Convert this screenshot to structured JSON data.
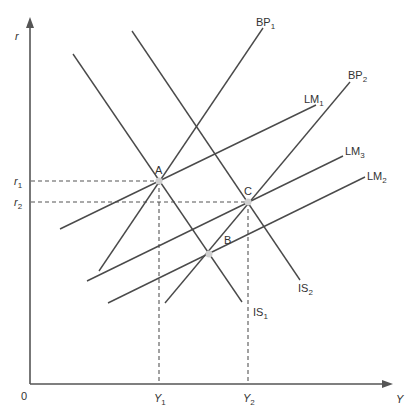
{
  "diagram": {
    "type": "IS-LM-BP",
    "axes": {
      "y_label": "r",
      "x_label": "Y",
      "origin_label": "0"
    },
    "y_ticks": [
      {
        "label": "r",
        "sub": "1",
        "id": "r1"
      },
      {
        "label": "r",
        "sub": "2",
        "id": "r2"
      }
    ],
    "x_ticks": [
      {
        "label": "Y",
        "sub": "1",
        "id": "Y1"
      },
      {
        "label": "Y",
        "sub": "2",
        "id": "Y2"
      }
    ],
    "curves": [
      {
        "name": "IS",
        "sub": "1",
        "id": "IS1"
      },
      {
        "name": "IS",
        "sub": "2",
        "id": "IS2"
      },
      {
        "name": "BP",
        "sub": "1",
        "id": "BP1"
      },
      {
        "name": "BP",
        "sub": "2",
        "id": "BP2"
      },
      {
        "name": "LM",
        "sub": "1",
        "id": "LM1"
      },
      {
        "name": "LM",
        "sub": "3",
        "id": "LM3"
      },
      {
        "name": "LM",
        "sub": "2",
        "id": "LM2"
      }
    ],
    "points": [
      {
        "label": "A",
        "desc": "IS1 ∩ LM1 ∩ BP1 at (Y1, r1)"
      },
      {
        "label": "B",
        "desc": "IS1 ∩ LM2 ∩ BP2"
      },
      {
        "label": "C",
        "desc": "IS2 ∩ LM3 ∩ BP2 at (Y2, r2)"
      }
    ],
    "colors": {
      "line": "#4a4a4a",
      "point": "#cfcfcf",
      "background": "#ffffff"
    }
  }
}
